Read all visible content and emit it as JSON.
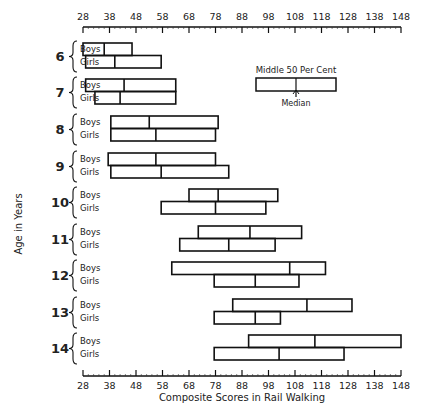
{
  "chart_data": {
    "type": "range-box",
    "title": "",
    "xlabel": "Composite Scores in Rail Walking",
    "ylabel": "Age in Years",
    "xlim": [
      28,
      148
    ],
    "xticks": [
      28,
      38,
      48,
      58,
      68,
      78,
      88,
      98,
      108,
      118,
      128,
      138,
      148
    ],
    "legend": {
      "title": "Middle 50 Per Cent",
      "median_label": "Median"
    },
    "series_labels": [
      "Boys",
      "Girls"
    ],
    "ages": [
      {
        "age": "6",
        "boys": {
          "q1": 28,
          "median": 36,
          "q3": 46.5
        },
        "girls": {
          "q1": 29,
          "median": 40,
          "q3": 57.5
        }
      },
      {
        "age": "7",
        "boys": {
          "q1": 29,
          "median": 43.5,
          "q3": 63
        },
        "girls": {
          "q1": 32.5,
          "median": 42,
          "q3": 63
        }
      },
      {
        "age": "8",
        "boys": {
          "q1": 38.5,
          "median": 53,
          "q3": 79
        },
        "girls": {
          "q1": 38.5,
          "median": 55.5,
          "q3": 78
        }
      },
      {
        "age": "9",
        "boys": {
          "q1": 37.5,
          "median": 55.5,
          "q3": 78
        },
        "girls": {
          "q1": 38.5,
          "median": 57.5,
          "q3": 83
        }
      },
      {
        "age": "10",
        "boys": {
          "q1": 68,
          "median": 79,
          "q3": 101.5
        },
        "girls": {
          "q1": 57.5,
          "median": 78,
          "q3": 97
        }
      },
      {
        "age": "11",
        "boys": {
          "q1": 71.5,
          "median": 91,
          "q3": 110.5
        },
        "girls": {
          "q1": 64.5,
          "median": 83,
          "q3": 100.5
        }
      },
      {
        "age": "12",
        "boys": {
          "q1": 61.5,
          "median": 106,
          "q3": 119.5
        },
        "girls": {
          "q1": 77.5,
          "median": 93,
          "q3": 109.5
        }
      },
      {
        "age": "13",
        "boys": {
          "q1": 84.5,
          "median": 112.5,
          "q3": 129.5
        },
        "girls": {
          "q1": 77.5,
          "median": 93,
          "q3": 102.5
        }
      },
      {
        "age": "14",
        "boys": {
          "q1": 90.5,
          "median": 115.5,
          "q3": 148
        },
        "girls": {
          "q1": 77.5,
          "median": 102,
          "q3": 126.5
        }
      }
    ]
  }
}
